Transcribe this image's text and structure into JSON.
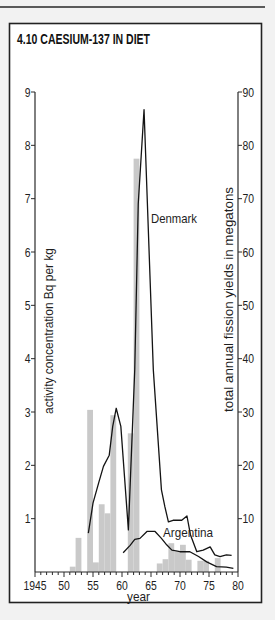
{
  "figure": {
    "title": "4.10 CAESIUM-137 IN DIET"
  },
  "colors": {
    "background": "#f2f2f2",
    "panel": "#ffffff",
    "bars": "#c9c9c9",
    "lines": "#141414",
    "axes": "#2a2a2a"
  },
  "chart_data": {
    "type": "bar",
    "title": "4.10 CAESIUM-137 IN DIET",
    "xlabel": "year",
    "ylabel": "activity concentration Bq per kg",
    "y2label": "total annual fission yields in megatons",
    "xlim": [
      1945,
      1980
    ],
    "ylim": [
      0,
      9
    ],
    "y2lim": [
      0,
      90
    ],
    "grid": false,
    "legend": "none (inline series labels)",
    "xticks": {
      "values": [
        1945,
        1950,
        1955,
        1960,
        1965,
        1970,
        1975,
        1980
      ],
      "labels": [
        "1945",
        "50",
        "55",
        "60",
        "65",
        "70",
        "75",
        "80"
      ],
      "minor_step": 1
    },
    "yticks": {
      "values": [
        1,
        2,
        3,
        4,
        5,
        6,
        7,
        8,
        9
      ],
      "labels": [
        "1",
        "2",
        "3",
        "4",
        "5",
        "6",
        "7",
        "8",
        "9"
      ]
    },
    "y2ticks": {
      "values": [
        10,
        20,
        30,
        40,
        50,
        60,
        70,
        80,
        90
      ],
      "labels": [
        "10",
        "20",
        "30",
        "40",
        "50",
        "60",
        "70",
        "80",
        "90"
      ]
    },
    "bars": {
      "name": "total annual fission yields (megatons)",
      "axis": "right",
      "x": [
        1951,
        1952,
        1954,
        1955,
        1956,
        1957,
        1958,
        1961,
        1962,
        1966,
        1967,
        1968,
        1969,
        1970,
        1971,
        1973,
        1974,
        1976
      ],
      "values": [
        1,
        6.4,
        30.4,
        1.8,
        12.7,
        11,
        29.4,
        26,
        77.5,
        1.6,
        2.4,
        5.4,
        3.8,
        5.1,
        2.3,
        2.1,
        2.1,
        2.6
      ]
    },
    "series": [
      {
        "name": "Denmark",
        "label": "Denmark",
        "type": "line",
        "axis": "left",
        "x": [
          1954.2,
          1955.0,
          1956.0,
          1956.8,
          1957.8,
          1958.4,
          1959.0,
          1959.8,
          1961.1,
          1962.2,
          1962.8,
          1963.8,
          1965.4,
          1966.8,
          1967.4,
          1968.0,
          1968.8,
          1970.3,
          1971.2,
          1971.8,
          1972.9,
          1974.0,
          1975.2,
          1976.0,
          1976.9,
          1978.0,
          1978.9
        ],
        "y": [
          0.73,
          1.29,
          1.68,
          1.98,
          2.19,
          2.73,
          3.07,
          2.73,
          0.79,
          3.8,
          6.9,
          8.67,
          3.79,
          1.54,
          1.22,
          0.94,
          0.97,
          0.97,
          1.05,
          0.7,
          0.38,
          0.41,
          0.47,
          0.32,
          0.29,
          0.32,
          0.31
        ]
      },
      {
        "name": "Argentina",
        "label": "Argentina",
        "type": "line",
        "axis": "left",
        "x": [
          1960.2,
          1961.4,
          1962.2,
          1963.1,
          1964.3,
          1965.7,
          1966.8,
          1967.7,
          1968.6,
          1970.0,
          1971.7,
          1973.2,
          1974.6,
          1976.3,
          1978.0,
          1979.2
        ],
        "y": [
          0.36,
          0.5,
          0.61,
          0.63,
          0.76,
          0.76,
          0.63,
          0.51,
          0.41,
          0.38,
          0.38,
          0.29,
          0.19,
          0.1,
          0.09,
          0.07
        ]
      }
    ]
  }
}
